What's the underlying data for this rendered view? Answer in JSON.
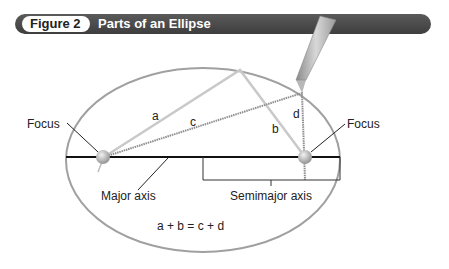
{
  "figure": {
    "number_label": "Figure 2",
    "title": "Parts of an Ellipse"
  },
  "labels": {
    "focus_left": "Focus",
    "focus_right": "Focus",
    "major_axis": "Major axis",
    "semimajor_axis": "Semimajor axis",
    "segment_a": "a",
    "segment_b": "b",
    "segment_c": "c",
    "segment_d": "d",
    "equation": "a + b = c + d"
  },
  "colors": {
    "header_bg": "#4a4a4a",
    "ellipse_stroke": "#9a9a9a",
    "string_light": "#c8c8c8",
    "string_dark": "#8e8e8e",
    "axis": "#111111"
  }
}
